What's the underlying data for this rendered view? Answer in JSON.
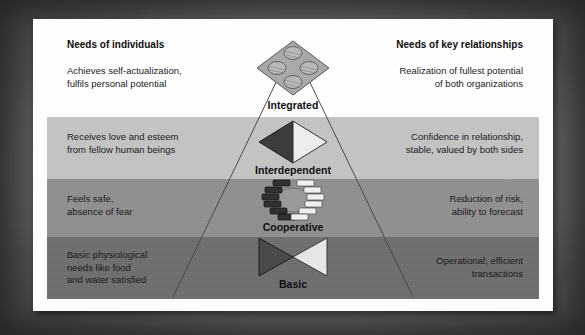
{
  "diagram": {
    "headers": {
      "left": "Needs of individuals",
      "right": "Needs of key relationships"
    },
    "levels": [
      {
        "name": "Integrated",
        "icon": "diamond-plate-with-four-spheres-icon",
        "left_text": "Achieves self-actualization,\nfulfils personal potential",
        "right_text": "Realization of fullest potential\nof both organizations",
        "band_color": "#ffffff"
      },
      {
        "name": "Interdependent",
        "icon": "two-triangles-diamond-icon",
        "left_text": "Receives love and esteem\nfrom fellow human beings",
        "right_text": "Confidence in relationship,\nstable, valued by both sides",
        "band_color": "#c3c3c3"
      },
      {
        "name": "Cooperative",
        "icon": "interlocking-blocks-ring-icon",
        "left_text": "Feels safe,\nabsence of fear",
        "right_text": "Reduction of risk,\nability to forecast",
        "band_color": "#8f8f8f"
      },
      {
        "name": "Basic",
        "icon": "bowtie-two-triangles-icon",
        "left_text": "Basic physiological\nneeds like food\nand water satisfied",
        "right_text": "Operational, efficient\ntransactions",
        "band_color": "#6e6e6e"
      }
    ],
    "colors": {
      "card": "#fdfdfd",
      "frame": "#4c4c4c",
      "text": "#1b1b1b",
      "icon_dark": "#3c3c3c",
      "icon_light": "#e8e8e8",
      "pyramid_line": "#4a4a4a"
    }
  }
}
